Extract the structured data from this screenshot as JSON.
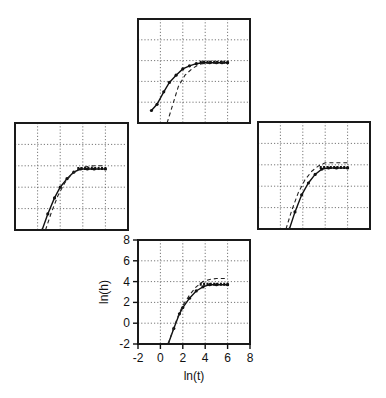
{
  "chart_data": [
    {
      "panel": "top",
      "type": "line",
      "title": "",
      "xlabel": "",
      "ylabel": "",
      "xlim": [
        -2,
        8
      ],
      "ylim": [
        -2,
        8
      ],
      "grid": true,
      "series": [
        {
          "name": "solid-with-markers",
          "style": "solid",
          "x": [
            -0.8,
            -0.3,
            0.3,
            0.8,
            1.4,
            2.0,
            2.6,
            3.2,
            3.8,
            4.4,
            5.0,
            5.5,
            6.0
          ],
          "y": [
            -0.8,
            -0.2,
            1.0,
            1.9,
            2.6,
            3.2,
            3.5,
            3.7,
            3.8,
            3.8,
            3.8,
            3.8,
            3.8
          ]
        },
        {
          "name": "dashed",
          "style": "dashed",
          "x": [
            0.6,
            1.0,
            1.6,
            2.2,
            2.8,
            3.4,
            4.0,
            5.0,
            6.0
          ],
          "y": [
            -2.0,
            -0.6,
            1.5,
            2.6,
            3.2,
            3.6,
            3.8,
            3.8,
            3.8
          ]
        }
      ]
    },
    {
      "panel": "left",
      "type": "line",
      "title": "",
      "xlabel": "",
      "ylabel": "",
      "xlim": [
        -2,
        8
      ],
      "ylim": [
        -2,
        8
      ],
      "grid": true,
      "series": [
        {
          "name": "solid-with-markers",
          "style": "solid",
          "x": [
            0.4,
            0.9,
            1.5,
            2.0,
            2.6,
            3.2,
            3.8,
            4.4,
            5.0,
            6.0
          ],
          "y": [
            -2.0,
            -0.5,
            1.0,
            2.0,
            2.8,
            3.4,
            3.7,
            3.7,
            3.7,
            3.7
          ]
        },
        {
          "name": "dashed",
          "style": "dashed",
          "x": [
            0.7,
            1.2,
            1.8,
            2.4,
            3.0,
            3.6,
            4.2,
            5.0,
            6.0
          ],
          "y": [
            -2.0,
            -0.4,
            1.2,
            2.4,
            3.2,
            3.7,
            3.9,
            4.0,
            4.0
          ]
        }
      ]
    },
    {
      "panel": "right",
      "type": "line",
      "title": "",
      "xlabel": "",
      "ylabel": "",
      "xlim": [
        -2,
        8
      ],
      "ylim": [
        -2,
        8
      ],
      "grid": true,
      "series": [
        {
          "name": "solid-with-markers",
          "style": "solid",
          "x": [
            0.8,
            1.3,
            1.9,
            2.5,
            3.1,
            3.7,
            4.3,
            5.0,
            6.0
          ],
          "y": [
            -2.0,
            -0.4,
            1.2,
            2.3,
            3.1,
            3.6,
            3.7,
            3.7,
            3.7
          ]
        },
        {
          "name": "dashed",
          "style": "dashed",
          "x": [
            0.5,
            1.0,
            1.6,
            2.2,
            2.8,
            3.4,
            4.0,
            5.0,
            6.0
          ],
          "y": [
            -2.0,
            -0.3,
            1.4,
            2.6,
            3.4,
            3.9,
            4.2,
            4.2,
            4.2
          ]
        }
      ]
    },
    {
      "panel": "bottom",
      "type": "line",
      "title": "",
      "xlabel": "ln(t)",
      "ylabel": "ln(h)",
      "xlim": [
        -2,
        8
      ],
      "ylim": [
        -2,
        8
      ],
      "xticks": [
        -2,
        0,
        2,
        4,
        6,
        8
      ],
      "yticks": [
        -2,
        0,
        2,
        4,
        6,
        8
      ],
      "grid": true,
      "series": [
        {
          "name": "solid-with-markers",
          "style": "solid",
          "x": [
            0.7,
            1.2,
            1.7,
            2.0,
            2.6,
            3.2,
            3.8,
            4.4,
            5.0,
            6.0
          ],
          "y": [
            -2.0,
            -0.5,
            0.9,
            1.5,
            2.4,
            3.1,
            3.5,
            3.7,
            3.7,
            3.7
          ]
        },
        {
          "name": "dashed",
          "style": "dashed",
          "x": [
            0.7,
            1.2,
            1.7,
            2.0,
            2.6,
            3.2,
            3.8,
            4.4,
            5.0,
            6.0
          ],
          "y": [
            -2.0,
            -0.4,
            1.0,
            1.7,
            2.7,
            3.5,
            4.0,
            4.2,
            4.3,
            4.3
          ]
        }
      ]
    }
  ],
  "axes": {
    "xlabel": "ln(t)",
    "ylabel": "ln(h)",
    "xticks": [
      "-2",
      "0",
      "2",
      "4",
      "6",
      "8"
    ],
    "yticks": [
      "8",
      "6",
      "4",
      "2",
      "0",
      "-2"
    ]
  },
  "colors": {
    "ink": "#111111",
    "background": "#ffffff"
  }
}
